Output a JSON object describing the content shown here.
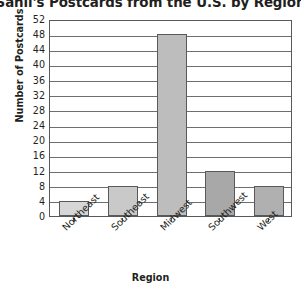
{
  "chart_data": {
    "type": "bar",
    "title": "Sahil's Postcards from the U.S. by Region",
    "xlabel": "Region",
    "ylabel": "Number of Postcards",
    "categories": [
      "Northeast",
      "Southeast",
      "Midwest",
      "Southwest",
      "West"
    ],
    "values": [
      4,
      8,
      48,
      12,
      8
    ],
    "ylim": [
      0,
      52
    ],
    "ytick_step": 4,
    "yticks": [
      52,
      48,
      44,
      40,
      36,
      32,
      28,
      24,
      20,
      16,
      12,
      8,
      4,
      0
    ],
    "grid": true,
    "legend": "none",
    "bar_colors": [
      "#d6d6d6",
      "#c9c9c9",
      "#bdbdbd",
      "#a8a8a8",
      "#b0b0b0"
    ],
    "bar_edge_color": "#58595b",
    "axis_color": "#58595b",
    "grid_color": "#6d6e71",
    "text_color": "#231f20",
    "background": "#ffffff"
  }
}
